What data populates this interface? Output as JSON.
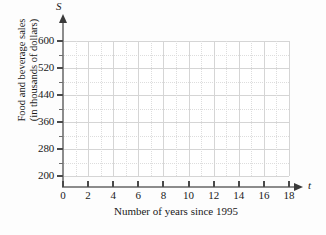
{
  "chart_data": {
    "type": "scatter",
    "title": "",
    "subtitle": "",
    "xlabel": "Number of years since 1995",
    "ylabel": "Food and beverage sales\n(in thousands of dollars)",
    "ylabel_line1": "Food and beverage sales",
    "ylabel_line2": "(in thousands of dollars)",
    "x_variable": "t",
    "y_variable": "S",
    "xlim": [
      0,
      18
    ],
    "ylim": [
      180,
      610
    ],
    "x_ticks": [
      0,
      2,
      4,
      6,
      8,
      10,
      12,
      14,
      16,
      18
    ],
    "x_tick_labels": [
      "0",
      "2",
      "4",
      "6",
      "8",
      "10",
      "12",
      "14",
      "16",
      "18"
    ],
    "y_ticks": [
      200,
      280,
      360,
      440,
      520,
      600
    ],
    "y_tick_labels": [
      "200",
      "280",
      "360",
      "440",
      "520",
      "600"
    ],
    "y_minor_ticks": [
      240,
      320,
      400,
      480,
      560
    ],
    "x_tick_step": 2,
    "y_tick_step": 80,
    "y_minor_step": 40,
    "grid": true,
    "grid_major_color": "#d5d5d5",
    "grid_minor_color": "#dddddd",
    "axis_color": "#8c8c8c",
    "legend": "none",
    "series": [
      {
        "name": "Food and beverage sales",
        "values": [],
        "x": []
      }
    ],
    "annotations": [],
    "note": "Empty coordinate grid provided for plotting data points."
  },
  "axis": {
    "y_variable_symbol": "S",
    "x_variable_symbol": "t"
  }
}
